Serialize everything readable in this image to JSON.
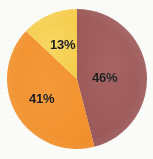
{
  "chart_data": {
    "type": "pie",
    "title": "",
    "subtitle": "",
    "xlabel": "",
    "ylabel": "",
    "legend": "none",
    "grid": false,
    "categories": [
      "Segment 1",
      "Segment 2",
      "Segment 3"
    ],
    "values": [
      46,
      41,
      13
    ],
    "labels": [
      "46%",
      "41%",
      "13%"
    ],
    "colors": [
      "#a05c5c",
      "#f4932f",
      "#f7d04f"
    ],
    "slices": [
      {
        "label": "46%",
        "value": 46,
        "color": "#a05c5c",
        "start_angle_deg": 0,
        "end_angle_deg": 165.6,
        "name": "maroon-slice"
      },
      {
        "label": "41%",
        "value": 41,
        "color": "#f4932f",
        "start_angle_deg": 165.6,
        "end_angle_deg": 313.2,
        "name": "orange-slice"
      },
      {
        "label": "13%",
        "value": 13,
        "color": "#f7d04f",
        "start_angle_deg": 313.2,
        "end_angle_deg": 360,
        "name": "yellow-slice"
      }
    ],
    "total": 100,
    "units": "percent",
    "background_color": "#fdfdfb",
    "label_color": "#1b1b1b",
    "center": {
      "x": 77,
      "y": 79
    },
    "radius": 70
  },
  "chart": {
    "label_46": "46%",
    "label_41": "41%",
    "label_13": "13%"
  }
}
